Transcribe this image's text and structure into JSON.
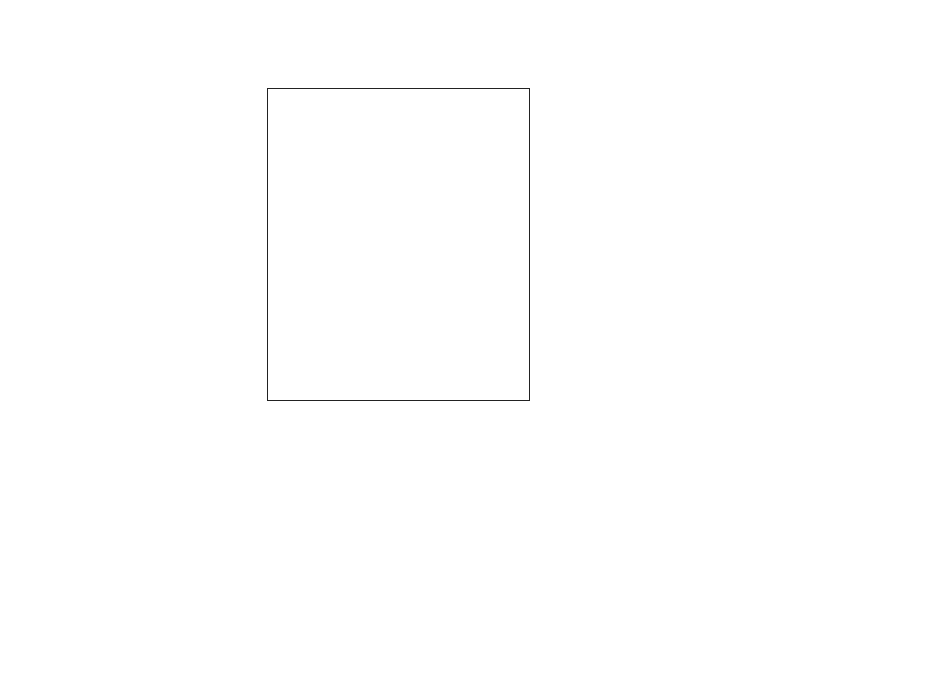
{
  "header": {
    "focus": "FOCUS: layfact"
  },
  "grid": {
    "column_order": [
      "1",
      "6",
      "4",
      "2",
      "7",
      "9",
      "8",
      "3",
      "5"
    ],
    "rows": [
      {
        "num": "5",
        "left": "external interface",
        "right": "internal interface",
        "values": [
          5,
          1,
          1,
          3,
          5,
          3,
          3,
          4,
          4
        ]
      },
      {
        "num": "7",
        "left": "inexpensive",
        "right": "can be expensive",
        "values": [
          3,
          1,
          1,
          3,
          2,
          2,
          5,
          5,
          3
        ]
      },
      {
        "num": "4",
        "left": "space-dependent",
        "right": "space-independent",
        "values": [
          4,
          1,
          5,
          2,
          2,
          3,
          3,
          4,
          3
        ]
      },
      {
        "num": "12",
        "left": "workload unaffected",
        "right": "affects workload",
        "values": [
          4,
          2,
          1,
          1,
          1,
          3,
          2,
          5,
          3
        ]
      },
      {
        "num": "10",
        "left": "cannot be automated",
        "right": "can be automated",
        "values": [
          1,
          3,
          1,
          1,
          1,
          1,
          3,
          5,
          4
        ]
      },
      {
        "num": "1",
        "left": "affects flow",
        "right": "does not affect flow",
        "values": [
          2,
          3,
          2,
          4,
          2,
          5,
          4,
          4,
          4
        ]
      },
      {
        "num": "11",
        "left": "does not improve environment",
        "right": "improves environment",
        "values": [
          2,
          1,
          2,
          3,
          4,
          5,
          5,
          2,
          4
        ]
      },
      {
        "num": "9",
        "left": "human not considered",
        "right": "human considered",
        "values": [
          3,
          1,
          2,
          2,
          3,
          5,
          5,
          4,
          1
        ]
      },
      {
        "num": "3",
        "left": "inflexible",
        "right": "flexible",
        "values": [
          2,
          1,
          2,
          2,
          4,
          4,
          2,
          4,
          3
        ]
      },
      {
        "num": "6",
        "left": "constraining",
        "right": "not constraining",
        "values": [
          1,
          1,
          2,
          3,
          3,
          4,
          2,
          4,
          4
        ]
      },
      {
        "num": "2",
        "left": "affects department location",
        "right": "does not affect department-",
        "right2": "location",
        "values": [
          1,
          2,
          3,
          3,
          4,
          4,
          3,
          4,
          5
        ]
      },
      {
        "num": "8",
        "left": "important",
        "right": "not important",
        "values": [
          1,
          2,
          3,
          2,
          4,
          3,
          1,
          2,
          5
        ]
      }
    ],
    "shading": {
      "1": "#ffffff",
      "2": "#ffffff",
      "3": "#b9b9b9",
      "4": "#7e7e7e",
      "5": "#7e7e7e"
    }
  },
  "entities": [
    {
      "num": "5",
      "label": "storage areas"
    },
    {
      "num": "3",
      "label": "material handling"
    },
    {
      "num": "8",
      "label": "safety"
    },
    {
      "num": "9",
      "label": "worker amenities"
    },
    {
      "num": "7",
      "label": "aisle space"
    },
    {
      "num": "2",
      "label": "area of department"
    },
    {
      "num": "4",
      "label": "location of services"
    },
    {
      "num": "6",
      "label": "existing facilities"
    },
    {
      "num": "1",
      "label": "proximity of sequential",
      "label2": "departments"
    }
  ],
  "attribute_tree_scale": {
    "ticks": [
      "100",
      "90",
      "80",
      "70",
      "60"
    ]
  },
  "entity_tree_scale": {
    "ticks": [
      "100",
      "90",
      "80",
      "70",
      "60",
      "50"
    ]
  }
}
